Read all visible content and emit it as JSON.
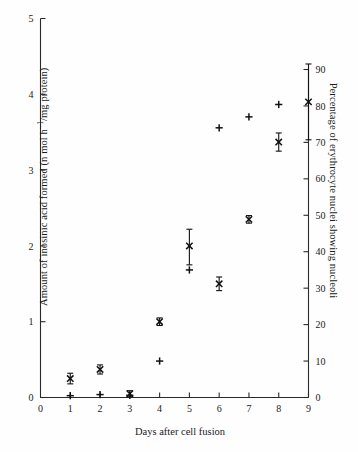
{
  "figure": {
    "background": "#fefefe",
    "ink_color": "#111111"
  },
  "chart_data": {
    "type": "scatter",
    "title": "",
    "xlabel": "Days after cell fusion",
    "ylabel": "Amount of inosinic acid formed (n mol h−1/mg protein)",
    "ylabel_right": "Percentage of erythrocyte nuclei showing nucleoli",
    "xlim": [
      0,
      9
    ],
    "ylim": [
      0,
      5
    ],
    "ylim_right": [
      0,
      90
    ],
    "grid": false,
    "legend": "none",
    "xticks": [
      0,
      1,
      2,
      3,
      4,
      5,
      6,
      7,
      8,
      9
    ],
    "xticklabels": [
      "0",
      "1",
      "2",
      "3",
      "4",
      "5",
      "6",
      "7",
      "8",
      "9"
    ],
    "yticks": [
      0,
      1,
      2,
      3,
      4,
      5
    ],
    "yticklabels": [
      "0",
      "1",
      "2",
      "3",
      "4",
      "5"
    ],
    "yticks_right": [
      0,
      10,
      20,
      30,
      40,
      50,
      60,
      70,
      80,
      90
    ],
    "yticklabels_right": [
      "0",
      "10",
      "20",
      "30",
      "40",
      "50",
      "60",
      "70",
      "80",
      "90"
    ],
    "series": [
      {
        "name": "Amount of inosinic acid formed",
        "marker": "cross",
        "axis": "left",
        "x": [
          1,
          2,
          3,
          4,
          5,
          6,
          7,
          8,
          9
        ],
        "y": [
          0.25,
          0.37,
          0.05,
          1.0,
          2.0,
          1.5,
          2.35,
          3.37,
          3.9
        ],
        "yerr_low": [
          0.07,
          0.06,
          0.04,
          0.05,
          0.25,
          0.09,
          0.05,
          0.12,
          0.5
        ],
        "yerr_high": [
          0.07,
          0.06,
          0.04,
          0.05,
          0.22,
          0.09,
          0.05,
          0.12,
          0.5
        ]
      },
      {
        "name": "Percentage of erythrocyte nuclei showing nucleoli",
        "marker": "plus",
        "axis": "right",
        "x": [
          1,
          2,
          3,
          4,
          5,
          6,
          7,
          8
        ],
        "y_right": [
          0.5,
          0.8,
          0.6,
          10.0,
          35.0,
          74.0,
          77.0,
          80.4
        ],
        "y_left_equiv": [
          0.03,
          0.04,
          0.03,
          0.55,
          1.75,
          3.7,
          3.85,
          4.02
        ]
      }
    ],
    "notes": [
      "Cross (×) markers with vertical error bars are plotted against the left axis.",
      "Plus (+) markers are plotted against the right percentage axis.",
      "A single cross with a long error bar sits on the right axis at day 9 (~78%)."
    ]
  }
}
